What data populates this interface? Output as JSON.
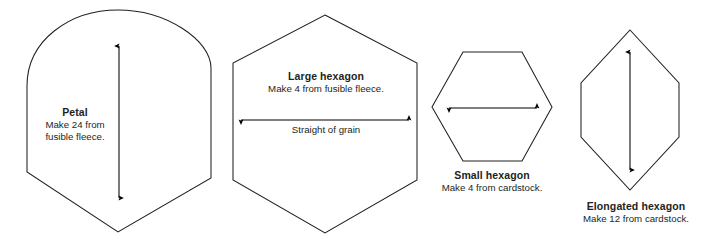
{
  "document": {
    "type": "sewing-pattern-template-sheet",
    "background_color": "#ffffff",
    "line_color": "#231f20",
    "text_color": "#231f20"
  },
  "pieces": [
    {
      "id": "petal",
      "title": "Petal",
      "instruction_line_1": "Make 24 from",
      "instruction_line_2": "fusible fleece.",
      "dimension_arrow": "vertical double-headed arrow"
    },
    {
      "id": "large-hexagon",
      "title": "Large hexagon",
      "instruction_line_1": "Make 4 from fusible fleece.",
      "grain_label": "Straight of grain",
      "dimension_arrow": "horizontal double-headed arrow"
    },
    {
      "id": "small-hexagon",
      "title": "Small hexagon",
      "instruction_line_1": "Make 4 from cardstock.",
      "dimension_arrow": "horizontal double-headed arrow"
    },
    {
      "id": "elongated-hexagon",
      "title": "Elongated hexagon",
      "instruction_line_1": "Make 12 from cardstock.",
      "dimension_arrow": "vertical double-headed arrow"
    }
  ]
}
